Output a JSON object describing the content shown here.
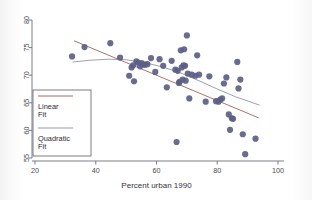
{
  "figure": {
    "background_color": "#ffffff",
    "plot_background_color": "#ffffff"
  },
  "chart_data": {
    "type": "scatter",
    "title": "",
    "subtitle": "",
    "xlabel": "Percent urban 1990",
    "ylabel": "",
    "xlim": [
      20,
      100
    ],
    "ylim": [
      55,
      80
    ],
    "xticks": [
      20,
      40,
      60,
      80,
      100
    ],
    "yticks": [
      55,
      60,
      65,
      70,
      75,
      80
    ],
    "xtick_labels": [
      "20",
      "40",
      "60",
      "80",
      "100"
    ],
    "ytick_labels": [
      "55",
      "60",
      "65",
      "70",
      "75",
      "80"
    ],
    "grid": false,
    "legend_position": "lower-left",
    "marker_color": "#5c5f86",
    "marker_size": 3.1,
    "series": [
      {
        "name": "observations",
        "type": "scatter",
        "points": [
          [
            32.2,
            73.4
          ],
          [
            36.3,
            75.1
          ],
          [
            44.8,
            75.8
          ],
          [
            48.0,
            73.2
          ],
          [
            51.0,
            69.9
          ],
          [
            51.8,
            71.4
          ],
          [
            52.3,
            71.8
          ],
          [
            52.6,
            68.9
          ],
          [
            53.4,
            72.5
          ],
          [
            53.9,
            72.3
          ],
          [
            54.6,
            71.6
          ],
          [
            55.1,
            72.2
          ],
          [
            55.6,
            71.9
          ],
          [
            56.3,
            71.9
          ],
          [
            57.0,
            72.0
          ],
          [
            58.2,
            73.1
          ],
          [
            59.6,
            70.6
          ],
          [
            61.0,
            72.9
          ],
          [
            62.2,
            71.7
          ],
          [
            63.4,
            67.8
          ],
          [
            65.0,
            72.6
          ],
          [
            66.2,
            71.0
          ],
          [
            66.6,
            57.9
          ],
          [
            67.0,
            70.8
          ],
          [
            67.4,
            68.6
          ],
          [
            67.6,
            68.8
          ],
          [
            68.0,
            74.5
          ],
          [
            68.3,
            71.4
          ],
          [
            68.6,
            69.2
          ],
          [
            68.9,
            71.8
          ],
          [
            69.1,
            74.7
          ],
          [
            69.4,
            71.7
          ],
          [
            69.6,
            69.0
          ],
          [
            70.0,
            77.2
          ],
          [
            70.3,
            70.3
          ],
          [
            70.8,
            65.8
          ],
          [
            71.6,
            70.1
          ],
          [
            72.8,
            69.9
          ],
          [
            73.4,
            73.6
          ],
          [
            74.0,
            70.1
          ],
          [
            76.2,
            65.2
          ],
          [
            77.4,
            69.8
          ],
          [
            79.6,
            65.3
          ],
          [
            80.4,
            65.2
          ],
          [
            81.0,
            65.6
          ],
          [
            81.6,
            65.8
          ],
          [
            82.2,
            68.5
          ],
          [
            83.0,
            69.6
          ],
          [
            83.8,
            62.9
          ],
          [
            84.2,
            60.1
          ],
          [
            84.8,
            62.2
          ],
          [
            85.2,
            62.1
          ],
          [
            86.6,
            72.4
          ],
          [
            87.0,
            67.6
          ],
          [
            87.6,
            69.2
          ],
          [
            88.4,
            59.3
          ],
          [
            89.2,
            55.7
          ],
          [
            92.6,
            58.5
          ]
        ]
      },
      {
        "name": "Linear Fit",
        "type": "line",
        "color": "#9c5a4e",
        "points": [
          [
            33.0,
            76.2
          ],
          [
            93.5,
            62.3
          ]
        ]
      },
      {
        "name": "Quadratic Fit",
        "type": "line",
        "color": "#8d8fa3",
        "points": [
          [
            32.5,
            72.4
          ],
          [
            38.0,
            72.7
          ],
          [
            44.0,
            72.9
          ],
          [
            50.0,
            72.8
          ],
          [
            56.0,
            72.3
          ],
          [
            62.0,
            71.5
          ],
          [
            68.0,
            70.4
          ],
          [
            74.0,
            69.0
          ],
          [
            80.0,
            67.5
          ],
          [
            86.0,
            66.1
          ],
          [
            93.8,
            64.6
          ]
        ]
      }
    ],
    "legend": [
      {
        "label_line1": "Linear",
        "label_line2": "Fit",
        "color": "#9c5a4e"
      },
      {
        "label_line1": "Quadratic",
        "label_line2": "Fit",
        "color": "#8d8fa3"
      }
    ]
  }
}
